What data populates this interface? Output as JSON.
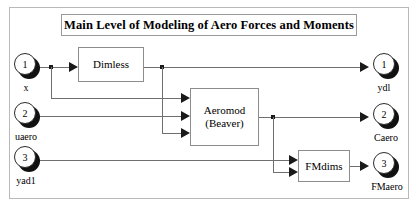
{
  "diagram": {
    "title": "Main Level of Modeling of Aero Forces and Moments",
    "frame_color": "#b9b9b9",
    "wire_color": "#6f6f6f",
    "block_border_color": "#8d8d8d",
    "background": "#ffffff"
  },
  "input_ports": [
    {
      "number": "1",
      "label": "x"
    },
    {
      "number": "2",
      "label": "uaero"
    },
    {
      "number": "3",
      "label": "yad1"
    }
  ],
  "output_ports": [
    {
      "number": "1",
      "label": "ydl"
    },
    {
      "number": "2",
      "label": "Caero"
    },
    {
      "number": "3",
      "label": "FMaero"
    }
  ],
  "blocks": [
    {
      "name": "dimless",
      "line1": "Dimless",
      "line2": ""
    },
    {
      "name": "aeromod",
      "line1": "Aeromod",
      "line2": "(Beaver)"
    },
    {
      "name": "fmdims",
      "line1": "FMdims",
      "line2": ""
    }
  ]
}
